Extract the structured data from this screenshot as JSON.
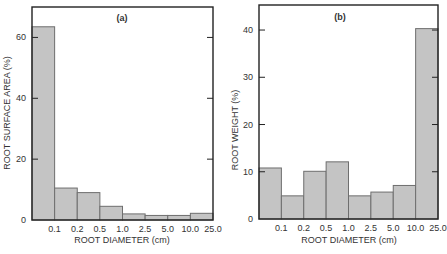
{
  "colors": {
    "bar_fill": "#c4c4c4",
    "bar_stroke": "#6e6e6e",
    "axis": "#222222",
    "text": "#333333"
  },
  "chart_data": [
    {
      "type": "bar",
      "panel_label": "(a)",
      "title": "",
      "xlabel": "ROOT DIAMETER (cm)",
      "ylabel": "ROOT SURFACE AREA (%)",
      "x_tick_labels": [
        "0.1",
        "0.2",
        "0.5",
        "1.0",
        "2.5",
        "5.0",
        "10.0",
        "25.0"
      ],
      "categories": [
        "<0.1",
        "0.1-0.2",
        "0.2-0.5",
        "0.5-1.0",
        "1.0-2.5",
        "2.5-5.0",
        "5.0-10.0",
        "10.0-25.0"
      ],
      "values": [
        63.5,
        10.5,
        9.0,
        4.5,
        2.0,
        1.5,
        1.5,
        2.2
      ],
      "yticks": [
        0,
        20,
        40,
        60
      ],
      "ylim": [
        0,
        70
      ],
      "grid": false,
      "legend": null,
      "frame": {
        "left": 32,
        "top": 7,
        "right": 213,
        "bottom": 220
      }
    },
    {
      "type": "bar",
      "panel_label": "(b)",
      "title": "",
      "xlabel": "ROOT DIAMETER (cm)",
      "ylabel": "ROOT WEIGHT (%)",
      "x_tick_labels": [
        "0.1",
        "0.2",
        "0.5",
        "1.0",
        "2.5",
        "5.0",
        "10.0",
        "25.0"
      ],
      "categories": [
        "<0.1",
        "0.1-0.2",
        "0.2-0.5",
        "0.5-1.0",
        "1.0-2.5",
        "2.5-5.0",
        "5.0-10.0",
        "10.0-25.0"
      ],
      "values": [
        10.8,
        4.9,
        10.1,
        12.1,
        4.9,
        5.7,
        7.1,
        40.3
      ],
      "yticks": [
        0,
        10,
        20,
        30,
        40
      ],
      "ylim": [
        0,
        45.3
      ],
      "grid": false,
      "legend": null,
      "frame": {
        "left": 259,
        "top": 5,
        "right": 438,
        "bottom": 219
      }
    }
  ]
}
